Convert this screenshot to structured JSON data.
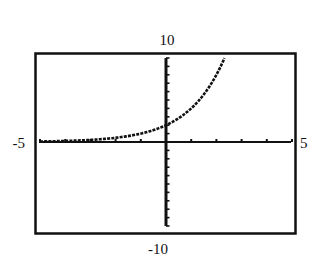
{
  "chart_data": {
    "type": "line",
    "title": "",
    "xlabel": "",
    "ylabel": "",
    "xlim": [
      -5,
      5
    ],
    "ylim": [
      -10,
      10
    ],
    "grid": false,
    "legend": null,
    "x_ticks_step": 1,
    "y_ticks_step": 1,
    "window_labels": {
      "xmin": "-5",
      "xmax": "5",
      "ymin": "-10",
      "ymax": "10"
    },
    "series": [
      {
        "name": "y = 2^(x+1)",
        "style": "dotted-pixel",
        "x": [
          -5,
          -4,
          -3,
          -2,
          -1,
          0,
          0.5,
          1,
          1.5,
          2,
          2.32
        ],
        "y": [
          0.0625,
          0.125,
          0.25,
          0.5,
          1,
          2,
          2.83,
          4,
          5.66,
          8,
          10
        ]
      }
    ]
  },
  "colors": {
    "background": "#ffffff",
    "ink": "#111111"
  }
}
